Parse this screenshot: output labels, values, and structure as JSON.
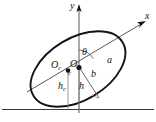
{
  "figure": {
    "kind": "geometry-diagram",
    "background_color": "#ffffff",
    "stroke_color": "#141414",
    "thin_stroke_color": "#555555",
    "axes": {
      "y_label": "y",
      "x_label": "x",
      "y_axis_note": "vertical axis with upward arrow",
      "x_axis_note": "inclined axis along ellipse major direction with arrow"
    },
    "angle": {
      "symbol": "θ",
      "meaning": "inclination of major axis from vertical axis"
    },
    "dimensions": [
      {
        "symbol": "a",
        "meaning": "semi-major axis"
      },
      {
        "symbol": "b",
        "meaning": "semi-minor axis"
      },
      {
        "symbol": "h",
        "meaning": "height of O above ground"
      },
      {
        "symbol": "h",
        "subscript": "c",
        "meaning": "height of centroid Oc above ground"
      }
    ],
    "points": [
      {
        "label": "O",
        "meaning": "origin of rotated axes"
      },
      {
        "label": "O",
        "subscript": "c",
        "meaning": "centroid of shape"
      },
      {
        "label": "c",
        "meaning": "centroid marker dot"
      }
    ],
    "ground": {
      "label": "",
      "meaning": "horizontal ground / reference line"
    }
  },
  "colors": {
    "stroke": "#141414",
    "thin": "#555555",
    "ground": "#3a3a3a",
    "background": "#ffffff"
  }
}
